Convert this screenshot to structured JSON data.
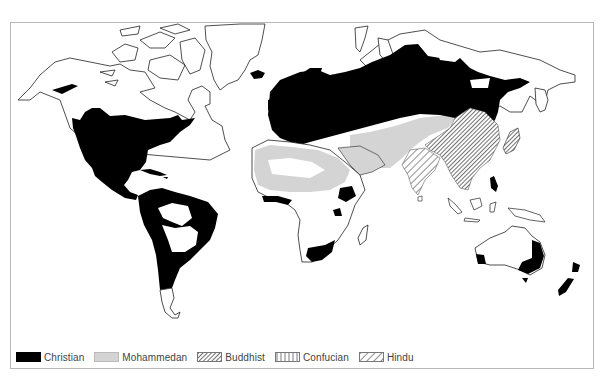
{
  "map": {
    "title": "",
    "type": "world religions distribution map",
    "regions": [
      {
        "name": "North America (USA, southern Canada, Mexico)",
        "religion": "Christian"
      },
      {
        "name": "Central America & Caribbean",
        "religion": "Christian"
      },
      {
        "name": "South America (except interior & Patagonia)",
        "religion": "Christian"
      },
      {
        "name": "Europe",
        "religion": "Christian"
      },
      {
        "name": "Russia / Siberia (southern belt)",
        "religion": "Christian"
      },
      {
        "name": "Iceland",
        "religion": "Christian"
      },
      {
        "name": "Southern Africa",
        "religion": "Christian"
      },
      {
        "name": "Ethiopia",
        "religion": "Christian"
      },
      {
        "name": "Philippines",
        "religion": "Christian"
      },
      {
        "name": "Eastern & Southwestern Australia",
        "religion": "Christian"
      },
      {
        "name": "New Zealand",
        "religion": "Christian"
      },
      {
        "name": "North Africa & Sahel",
        "religion": "Mohammedan"
      },
      {
        "name": "Middle East & Arabia",
        "religion": "Mohammedan"
      },
      {
        "name": "Central Asia",
        "religion": "Mohammedan"
      },
      {
        "name": "China, Korea, Indochina",
        "religion": "Buddhist/Confucian"
      },
      {
        "name": "Japan",
        "religion": "Buddhist"
      },
      {
        "name": "India",
        "religion": "Hindu"
      }
    ]
  },
  "legend": {
    "items": [
      {
        "label": "Christian",
        "key": "christian",
        "color": "#000000"
      },
      {
        "label": "Mohammedan",
        "key": "mohammedan",
        "color": "#d4d4d4"
      },
      {
        "label": "Buddhist",
        "key": "buddhist",
        "pattern": "fine-diagonal-hatch"
      },
      {
        "label": "Confucian",
        "key": "confucian",
        "pattern": "vertical-lines"
      },
      {
        "label": "Hindu",
        "key": "hindu",
        "pattern": "wide-diagonal-hatch"
      }
    ]
  },
  "colors": {
    "christian": "#000000",
    "mohammedan": "#d4d4d4",
    "outline": "#222222",
    "frame": "#b8b8b8"
  }
}
